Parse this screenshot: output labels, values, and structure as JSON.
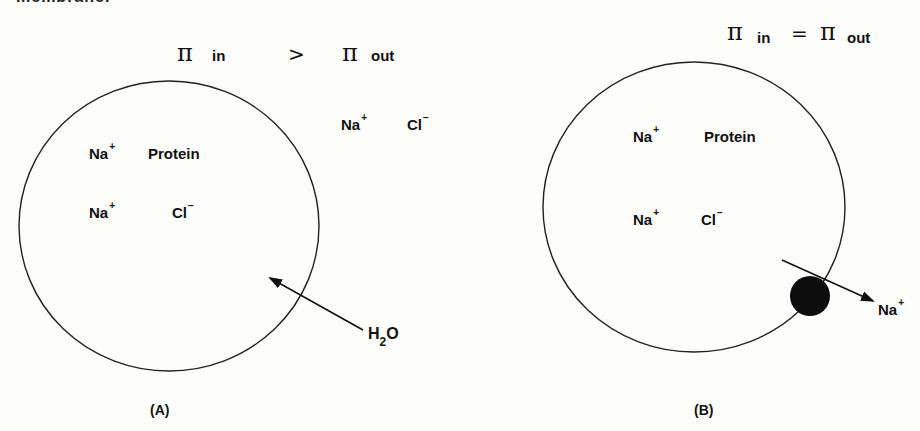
{
  "header": {
    "cutoff_text": "membrane."
  },
  "panel_a": {
    "label": "(A)",
    "equation": {
      "left_symbol": "π",
      "left_sub": "in",
      "operator": ">",
      "right_symbol": "π",
      "right_sub": "out"
    },
    "outside_ions": [
      {
        "text": "Na",
        "charge": "+"
      },
      {
        "text": "Cl",
        "charge": "−"
      }
    ],
    "inside": [
      {
        "text": "Na",
        "charge": "+"
      },
      {
        "text": "Protein",
        "charge": ""
      },
      {
        "text": "Na",
        "charge": "+"
      },
      {
        "text": "Cl",
        "charge": "−"
      }
    ],
    "arrow_label": {
      "main": "H",
      "sub": "2",
      "tail": "O"
    }
  },
  "panel_b": {
    "label": "(B)",
    "equation": {
      "left_symbol": "π",
      "left_sub": "in",
      "operator": "=",
      "right_symbol": "π",
      "right_sub": "out"
    },
    "inside": [
      {
        "text": "Na",
        "charge": "+"
      },
      {
        "text": "Protein",
        "charge": ""
      },
      {
        "text": "Na",
        "charge": "+"
      },
      {
        "text": "Cl",
        "charge": "−"
      }
    ],
    "arrow_label": {
      "text": "Na",
      "charge": "+"
    },
    "pump": "sodium-pump"
  },
  "colors": {
    "ink": "#111111",
    "background": "#fdfdfc"
  }
}
